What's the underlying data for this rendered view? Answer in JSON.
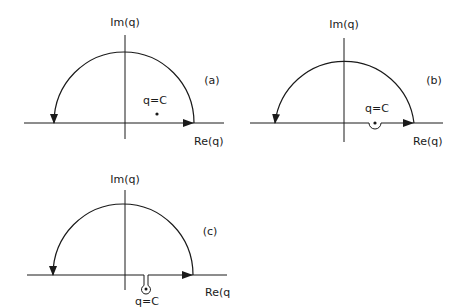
{
  "figure": {
    "colors": {
      "ink": "#1a1a1a",
      "background": "#ffffff"
    },
    "panels": [
      {
        "id": "a",
        "tag": "(a)",
        "x_axis_label": "Re(q)",
        "y_axis_label": "Im(q)",
        "pole_label": "q=C",
        "pole_location": "upper half-plane, inside contour",
        "contour": "real axis closed by upper semicircle, counter-clockwise"
      },
      {
        "id": "b",
        "tag": "(b)",
        "x_axis_label": "Re(q)",
        "y_axis_label": "Im(q)",
        "pole_label": "q=C",
        "pole_location": "on real axis, contour indented below pole",
        "contour": "real axis with small semicircular indentation below pole, closed by upper semicircle"
      },
      {
        "id": "c",
        "tag": "(c)",
        "x_axis_label": "Re(q",
        "y_axis_label": "Im(q)",
        "pole_label": "q=C",
        "pole_location": "lower half-plane, enclosed by keyhole detour",
        "contour": "real axis with keyhole excursion down around pole, closed by upper semicircle"
      }
    ]
  }
}
